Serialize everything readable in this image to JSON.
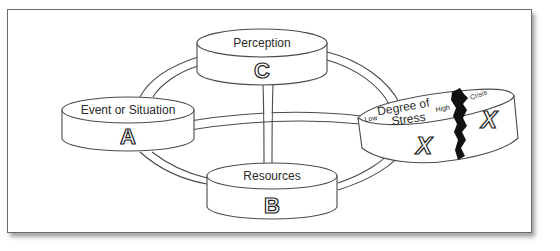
{
  "diagram": {
    "nodes": [
      {
        "id": "A",
        "label": "Event or Situation",
        "letter": "A"
      },
      {
        "id": "B",
        "label": "Resources",
        "letter": "B"
      },
      {
        "id": "C",
        "label": "Perception",
        "letter": "C"
      },
      {
        "id": "X",
        "label_line1": "Degree of",
        "label_line2": "Stress",
        "letter": "X",
        "scale_low": "Low",
        "scale_high": "High",
        "scale_crisis": "Crisis",
        "crisis_letter": "X"
      }
    ],
    "colors": {
      "stroke": "#4a4a4a",
      "background": "#ffffff",
      "crack": "#111111",
      "frame_border": "#6a6a6a"
    }
  }
}
